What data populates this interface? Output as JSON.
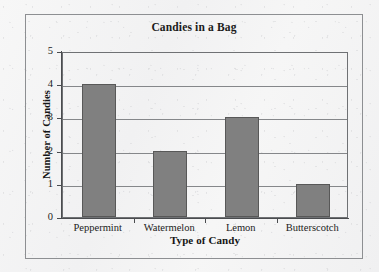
{
  "chart_data": {
    "type": "bar",
    "title": "Candies in a Bag",
    "xlabel": "Type of Candy",
    "ylabel": "Number of Candies",
    "categories": [
      "Peppermint",
      "Watermelon",
      "Lemon",
      "Butterscotch"
    ],
    "values": [
      4,
      2,
      3,
      1
    ],
    "ylim": [
      0,
      5
    ],
    "ytick_labels": [
      "5",
      "4",
      "3",
      "2",
      "1",
      "0"
    ],
    "ytick_values": [
      5,
      4,
      3,
      2,
      1,
      0
    ],
    "grid": "horizontal",
    "legend": "none",
    "bar_color": "#808080",
    "bar_edge_color": "#585858",
    "axis_color": "#4a4c4f",
    "grid_color": "#85878a",
    "frame_color": "#8d8f92",
    "background_color": "#f4f4f4",
    "text_color": "#1b1b1b"
  },
  "ticks": {
    "y": [
      {
        "label": "5",
        "value": 5
      },
      {
        "label": "4",
        "value": 4
      },
      {
        "label": "3",
        "value": 3
      },
      {
        "label": "2",
        "value": 2
      },
      {
        "label": "1",
        "value": 1
      },
      {
        "label": "0",
        "value": 0
      }
    ]
  },
  "bars": [
    {
      "category": "Peppermint",
      "value": 4
    },
    {
      "category": "Watermelon",
      "value": 2
    },
    {
      "category": "Lemon",
      "value": 3
    },
    {
      "category": "Butterscotch",
      "value": 1
    }
  ]
}
